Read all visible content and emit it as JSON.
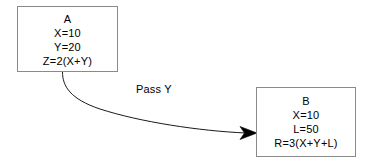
{
  "diagram": {
    "type": "flow-diagram",
    "background_color": "#ffffff",
    "stroke_color": "#000000",
    "box_border_color": "#8a8a8a",
    "nodes": [
      {
        "id": "A",
        "title": "A",
        "lines": [
          "X=10",
          "Y=20",
          "Z=2(X+Y)"
        ]
      },
      {
        "id": "B",
        "title": "B",
        "lines": [
          "X=10",
          "L=50",
          "R=3(X+Y+L)"
        ]
      }
    ],
    "edges": [
      {
        "from": "A",
        "to": "B",
        "label": "Pass Y",
        "style": "curved-arrow",
        "arrowhead": "filled-triangle"
      }
    ]
  }
}
